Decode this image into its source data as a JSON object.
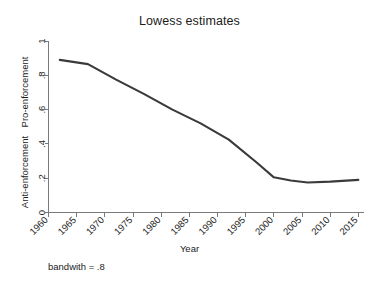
{
  "chart_data": {
    "type": "line",
    "title": "Lowess estimates",
    "xlabel": "Year",
    "ylabel": "",
    "ylabel_lower": "Anti-enforcement",
    "ylabel_upper": "Pro-enforcement",
    "note": "bandwith = .8",
    "xlim": [
      1960,
      2016
    ],
    "ylim": [
      0,
      1
    ],
    "grid": false,
    "legend": "none",
    "line_color": "#3a3a3a",
    "axis_color": "#7a7a7a",
    "xticks": [
      1960,
      1965,
      1970,
      1975,
      1980,
      1985,
      1990,
      1995,
      2000,
      2005,
      2010,
      2015
    ],
    "xtick_labels": [
      "1960",
      "1965",
      "1970",
      "1975",
      "1980",
      "1985",
      "1990",
      "1995",
      "2000",
      "2005",
      "2010",
      "2015"
    ],
    "yticks": [
      0,
      0.2,
      0.4,
      0.6,
      0.8,
      1
    ],
    "ytick_labels": [
      "0",
      ".2",
      ".4",
      ".6",
      ".8",
      "1"
    ],
    "series": [
      {
        "name": "lowess smooth",
        "x": [
          1962,
          1967,
          1972,
          1977,
          1982,
          1987,
          1992,
          1997,
          2000,
          2003,
          2006,
          2010,
          2015
        ],
        "values": [
          0.89,
          0.865,
          0.775,
          0.69,
          0.6,
          0.52,
          0.425,
          0.29,
          0.205,
          0.187,
          0.175,
          0.18,
          0.19
        ]
      }
    ]
  },
  "figure": {
    "title": "Lowess estimates",
    "x_axis_title": "Year",
    "note": "bandwith = .8",
    "y_label_upper": "Pro-enforcement",
    "y_label_lower": "Anti-enforcement"
  }
}
